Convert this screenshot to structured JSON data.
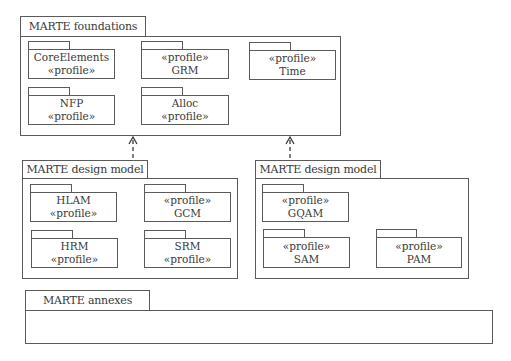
{
  "diagram": {
    "type": "uml-package-diagram",
    "stereotype_text": "«profile»"
  },
  "foundations": {
    "title": "MARTE foundations",
    "packages": [
      {
        "name": "CoreElements",
        "line1": "CoreElements",
        "line2": "«profile»"
      },
      {
        "name": "GRM",
        "line1": "«profile»",
        "line2": "GRM"
      },
      {
        "name": "Time",
        "line1": "«profile»",
        "line2": "Time"
      },
      {
        "name": "NFP",
        "line1": "NFP",
        "line2": "«profile»"
      },
      {
        "name": "Alloc",
        "line1": "Alloc",
        "line2": "«profile»"
      }
    ]
  },
  "design_left": {
    "title": "MARTE design model",
    "packages": [
      {
        "name": "HLAM",
        "line1": "HLAM",
        "line2": "«profile»"
      },
      {
        "name": "GCM",
        "line1": "«profile»",
        "line2": "GCM"
      },
      {
        "name": "HRM",
        "line1": "HRM",
        "line2": "«profile»"
      },
      {
        "name": "SRM",
        "line1": "SRM",
        "line2": "«profile»"
      }
    ]
  },
  "design_right": {
    "title": "MARTE design model",
    "packages": [
      {
        "name": "GQAM",
        "line1": "«profile»",
        "line2": "GQAM"
      },
      {
        "name": "SAM",
        "line1": "«profile»",
        "line2": "SAM"
      },
      {
        "name": "PAM",
        "line1": "«profile»",
        "line2": "PAM"
      }
    ]
  },
  "annexes": {
    "title": "MARTE annexes"
  },
  "dependencies": [
    {
      "from": "design_left",
      "to": "foundations",
      "style": "dashed",
      "arrowhead": "open"
    },
    {
      "from": "design_right",
      "to": "foundations",
      "style": "dashed",
      "arrowhead": "open"
    }
  ],
  "colors": {
    "line": "#5a5a5a",
    "text": "#3a3a3a",
    "background": "#ffffff"
  }
}
